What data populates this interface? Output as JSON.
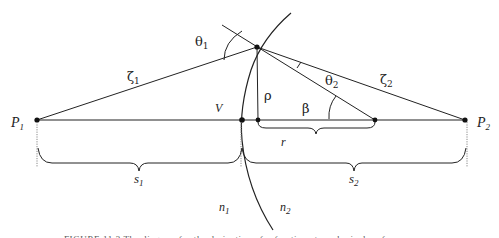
{
  "figure": {
    "type": "refraction-at-spherical-surface",
    "points": {
      "p1": {
        "label": "P",
        "sub": "1"
      },
      "p2": {
        "label": "P",
        "sub": "2"
      },
      "vertex": {
        "label": "V"
      }
    },
    "angles": {
      "theta1": {
        "label": "θ",
        "sub": "1"
      },
      "theta2": {
        "label": "θ",
        "sub": "2"
      },
      "beta": {
        "label": "β"
      }
    },
    "segments": {
      "zeta1": {
        "label": "ζ",
        "sub": "1"
      },
      "zeta2": {
        "label": "ζ",
        "sub": "2"
      },
      "rho": {
        "label": "ρ"
      }
    },
    "distances": {
      "r": {
        "label": "r"
      },
      "s1": {
        "label": "s",
        "sub": "1"
      },
      "s2": {
        "label": "s",
        "sub": "2"
      }
    },
    "media": {
      "n1": {
        "label": "n",
        "sub": "1"
      },
      "n2": {
        "label": "n",
        "sub": "2"
      }
    },
    "caption": "FIGURE 11.3   The diagram for the derivation of refraction at a spherical surface"
  },
  "colors": {
    "line": "#222222",
    "dotted": "#888888",
    "background": "#ffffff"
  }
}
